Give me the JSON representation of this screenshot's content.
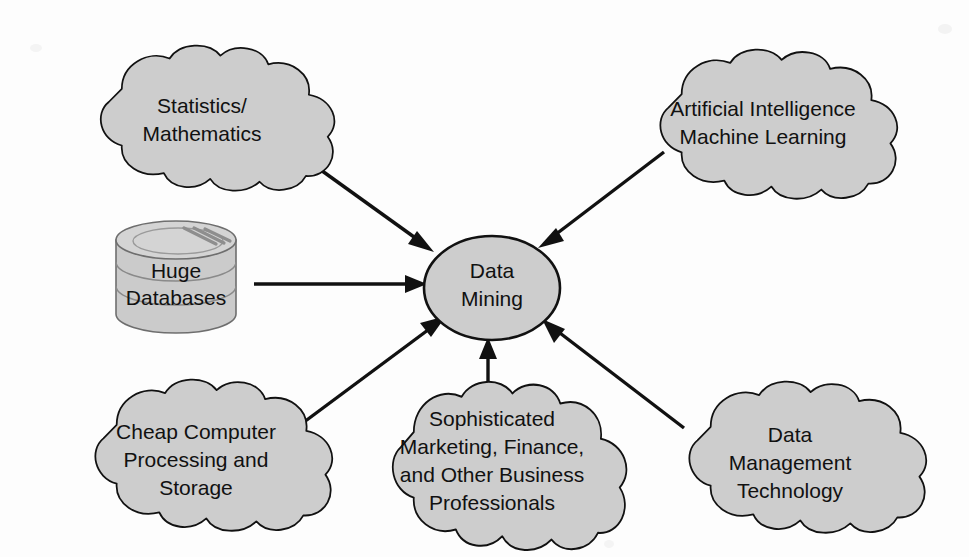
{
  "diagram": {
    "background_color": "#fdfdfd",
    "node_fill_color": "#cdcdcd",
    "node_stroke_color": "#111111",
    "edge_color": "#111111",
    "text_color": "#111111",
    "center": {
      "id": "data-mining",
      "shape": "ellipse",
      "label_lines": [
        "Data",
        "Mining"
      ],
      "line1": "Data",
      "line2": "Mining",
      "cx": 492,
      "cy": 288,
      "rx": 68,
      "ry": 52
    },
    "nodes": [
      {
        "id": "statistics-mathematics",
        "shape": "cloud",
        "position": "top-left",
        "label_lines": [
          "Statistics/",
          "Mathematics"
        ],
        "line1": "Statistics/",
        "line2": "Mathematics",
        "cx": 202,
        "cy": 117
      },
      {
        "id": "artificial-intelligence-machine-learning",
        "shape": "cloud",
        "position": "top-right",
        "label_lines": [
          "Artificial Intelligence",
          "Machine Learning"
        ],
        "line1": "Artificial Intelligence",
        "line2": "Machine Learning",
        "cx": 763,
        "cy": 122
      },
      {
        "id": "huge-databases",
        "shape": "database-cylinder",
        "position": "middle-left",
        "label_lines": [
          "Huge",
          "Databases"
        ],
        "line1": "Huge",
        "line2": "Databases",
        "cx": 176,
        "cy": 281
      },
      {
        "id": "cheap-computer-processing-and-storage",
        "shape": "cloud",
        "position": "bottom-left",
        "label_lines": [
          "Cheap Computer",
          "Processing and",
          "Storage"
        ],
        "line1": "Cheap Computer",
        "line2": "Processing and",
        "line3": "Storage",
        "cx": 196,
        "cy": 452
      },
      {
        "id": "sophisticated-business-professionals",
        "shape": "cloud",
        "position": "bottom-center",
        "label_lines": [
          "Sophisticated",
          "Marketing, Finance,",
          "and Other Business",
          "Professionals"
        ],
        "line1": "Sophisticated",
        "line2": "Marketing, Finance,",
        "line3": "and Other Business",
        "line4": "Professionals",
        "cx": 492,
        "cy": 462
      },
      {
        "id": "data-management-technology",
        "shape": "cloud",
        "position": "bottom-right",
        "label_lines": [
          "Data",
          "Management",
          "Technology"
        ],
        "line1": "Data",
        "line2": "Management",
        "line3": "Technology",
        "cx": 790,
        "cy": 455
      }
    ],
    "edges": [
      {
        "id": "edge-statistics-to-data-mining",
        "from": "statistics-mathematics",
        "to": "data-mining",
        "arrow": "to-center",
        "direction": "down-right"
      },
      {
        "id": "edge-ai-to-data-mining",
        "from": "artificial-intelligence-machine-learning",
        "to": "data-mining",
        "arrow": "to-center",
        "direction": "down-left"
      },
      {
        "id": "edge-databases-to-data-mining",
        "from": "huge-databases",
        "to": "data-mining",
        "arrow": "to-center",
        "direction": "right"
      },
      {
        "id": "edge-cheap-computer-to-data-mining",
        "from": "cheap-computer-processing-and-storage",
        "to": "data-mining",
        "arrow": "to-center",
        "direction": "up-right"
      },
      {
        "id": "edge-professionals-to-data-mining",
        "from": "sophisticated-business-professionals",
        "to": "data-mining",
        "arrow": "to-center",
        "direction": "up"
      },
      {
        "id": "edge-data-management-to-data-mining",
        "from": "data-management-technology",
        "to": "data-mining",
        "arrow": "to-center",
        "direction": "up-left"
      }
    ]
  }
}
